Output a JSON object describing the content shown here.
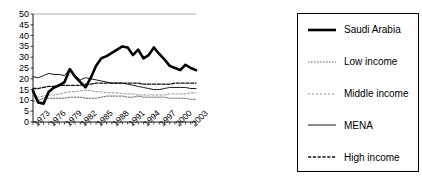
{
  "chart_data": {
    "type": "line",
    "title": "",
    "xlabel": "",
    "ylabel": "",
    "ylim": [
      0,
      50
    ],
    "ytick_step": 5,
    "yticks": [
      0,
      5,
      10,
      15,
      20,
      25,
      30,
      35,
      40,
      45,
      50
    ],
    "grid": false,
    "legend_position": "right-outside",
    "x": [
      1973,
      1974,
      1975,
      1976,
      1977,
      1978,
      1979,
      1980,
      1981,
      1982,
      1983,
      1984,
      1985,
      1986,
      1987,
      1988,
      1989,
      1990,
      1991,
      1992,
      1993,
      1994,
      1995,
      1996,
      1997,
      1998,
      1999,
      2000,
      2001,
      2002,
      2003,
      2004
    ],
    "xtick_labels": [
      "1973",
      "1976",
      "1979",
      "1982",
      "1985",
      "1988",
      "1991",
      "1994",
      "1997",
      "2000",
      "2003"
    ],
    "xtick_values": [
      1973,
      1976,
      1979,
      1982,
      1985,
      1988,
      1991,
      1994,
      1997,
      2000,
      2003
    ],
    "series": [
      {
        "name": "Saudi Arabia",
        "style": "thick-solid",
        "color": "#000000",
        "values": [
          14.5,
          9.0,
          8.5,
          14.0,
          16.0,
          17.0,
          18.5,
          24.5,
          21.0,
          18.5,
          16.0,
          20.5,
          26.0,
          29.5,
          30.5,
          32.0,
          33.5,
          35.0,
          34.5,
          31.0,
          33.5,
          29.5,
          31.0,
          34.5,
          31.5,
          29.0,
          26.0,
          25.0,
          24.0,
          26.5,
          25.0,
          24.0
        ]
      },
      {
        "name": "Low income",
        "style": "fine-dotted",
        "color": "#555555",
        "values": [
          9.5,
          10.0,
          11.0,
          11.0,
          11.0,
          11.0,
          11.0,
          11.5,
          11.5,
          11.5,
          11.0,
          11.0,
          11.0,
          11.5,
          12.0,
          12.0,
          12.0,
          12.0,
          11.5,
          11.5,
          12.0,
          11.5,
          11.5,
          11.5,
          11.5,
          11.5,
          11.0,
          11.0,
          11.0,
          11.0,
          10.5,
          10.5
        ]
      },
      {
        "name": "Middle income",
        "style": "light-dotted",
        "color": "#888888",
        "values": [
          11.0,
          11.5,
          12.0,
          12.5,
          12.5,
          13.0,
          13.5,
          14.0,
          14.0,
          14.5,
          14.5,
          14.5,
          14.0,
          14.0,
          13.5,
          13.5,
          13.5,
          13.0,
          13.0,
          13.0,
          12.5,
          12.5,
          12.5,
          12.5,
          12.5,
          12.5,
          13.0,
          13.0,
          13.0,
          13.0,
          13.5,
          13.5
        ]
      },
      {
        "name": "MENA",
        "style": "thin-solid",
        "color": "#000000",
        "values": [
          21.0,
          20.5,
          21.5,
          22.5,
          22.0,
          22.0,
          21.5,
          24.5,
          21.5,
          19.5,
          20.5,
          20.0,
          19.5,
          19.0,
          18.5,
          18.0,
          18.0,
          18.0,
          17.5,
          17.0,
          16.5,
          16.0,
          15.5,
          15.0,
          15.0,
          15.5,
          16.0,
          16.0,
          16.0,
          16.0,
          15.5,
          15.5
        ]
      },
      {
        "name": "High income",
        "style": "dashed",
        "color": "#111111",
        "values": [
          15.5,
          15.5,
          16.0,
          16.5,
          16.5,
          17.0,
          17.0,
          17.0,
          17.0,
          17.0,
          17.5,
          17.5,
          18.0,
          18.0,
          18.0,
          18.0,
          18.0,
          18.0,
          18.0,
          18.0,
          18.0,
          17.5,
          17.5,
          17.5,
          17.5,
          17.5,
          17.5,
          18.0,
          18.0,
          18.0,
          18.0,
          18.0
        ]
      }
    ]
  },
  "legend": {
    "entries": [
      {
        "label": "Saudi Arabia"
      },
      {
        "label": "Low income"
      },
      {
        "label": "Middle income"
      },
      {
        "label": "MENA"
      },
      {
        "label": "High income"
      }
    ]
  }
}
